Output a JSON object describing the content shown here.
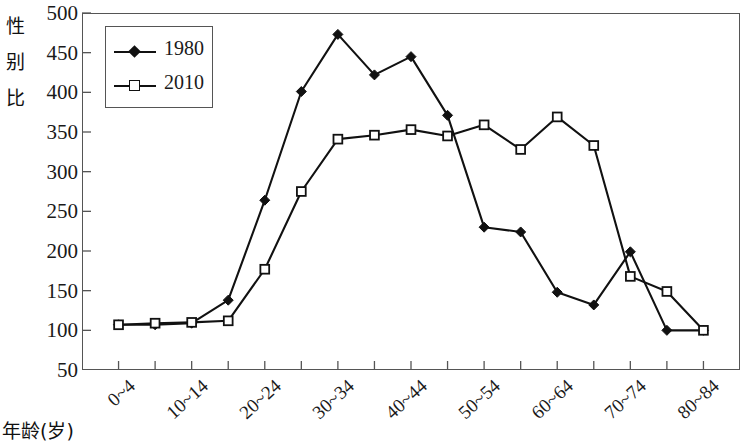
{
  "chart_data": {
    "type": "line",
    "title": "",
    "xlabel": "年龄(岁)",
    "ylabel": "性别比",
    "ylabel_chars": [
      "性",
      "别",
      "比"
    ],
    "categories": [
      "0~4",
      "5~9",
      "10~14",
      "15~19",
      "20~24",
      "25~29",
      "30~34",
      "35~39",
      "40~44",
      "45~49",
      "50~54",
      "55~59",
      "60~64",
      "65~69",
      "70~74",
      "75~79",
      "80~84"
    ],
    "xticklabels": [
      "0~4",
      "10~14",
      "20~24",
      "30~34",
      "40~44",
      "50~54",
      "60~64",
      "70~74",
      "80~84"
    ],
    "xtick_every": 2,
    "yticks": [
      100,
      150,
      200,
      250,
      300,
      350,
      400,
      450,
      500
    ],
    "ylim": [
      50,
      500
    ],
    "ytick_bottom_label": "50",
    "grid": false,
    "legend_position": "upper-left",
    "series": [
      {
        "name": "1980",
        "marker": "filled-diamond",
        "color": "#111111",
        "values": [
          107,
          107,
          109,
          138,
          264,
          401,
          473,
          422,
          445,
          371,
          230,
          224,
          148,
          132,
          199,
          100,
          100
        ]
      },
      {
        "name": "2010",
        "marker": "open-square",
        "color": "#111111",
        "values": [
          107,
          109,
          110,
          112,
          177,
          275,
          341,
          346,
          353,
          345,
          359,
          328,
          369,
          333,
          168,
          149,
          100
        ]
      }
    ]
  },
  "legend": {
    "entries": [
      {
        "label": "1980",
        "marker": "filled-diamond"
      },
      {
        "label": "2010",
        "marker": "open-square"
      }
    ]
  },
  "axes": {
    "y_title": "性别比",
    "x_title": "年龄(岁)"
  }
}
